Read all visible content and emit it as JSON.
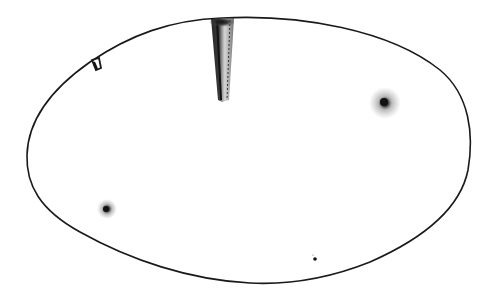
{
  "figure": {
    "stroke_color": "#1a1a1a",
    "background_color": "#ffffff",
    "outline": {
      "left_x": 26,
      "right_x": 470,
      "top_y": 17,
      "bottom_y": 284
    },
    "marks": [
      {
        "name": "vertical-stem",
        "x": 222,
        "y_top": 18,
        "y_bottom": 100,
        "width": 10
      },
      {
        "name": "small-notch",
        "x": 96,
        "y": 63
      },
      {
        "name": "stipple-spot-right",
        "x": 385,
        "y": 103,
        "radius": 8
      },
      {
        "name": "stipple-spot-left",
        "x": 107,
        "y": 209,
        "radius": 6
      },
      {
        "name": "tiny-dot",
        "x": 315,
        "y": 259,
        "radius": 2
      }
    ]
  }
}
